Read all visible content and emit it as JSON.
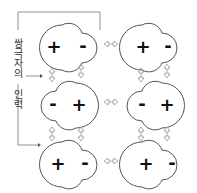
{
  "diagram": {
    "label": "쌍극자의 인력",
    "colors": {
      "outline": "#555555",
      "arrow": "#999999",
      "sign": "#111111"
    },
    "molecules": [
      {
        "row": 0,
        "col": 0,
        "left": "+",
        "right": "-"
      },
      {
        "row": 0,
        "col": 1,
        "left": "+",
        "right": "-"
      },
      {
        "row": 1,
        "col": 0,
        "left": "-",
        "right": "+"
      },
      {
        "row": 1,
        "col": 1,
        "left": "-",
        "right": "+"
      },
      {
        "row": 2,
        "col": 0,
        "left": "+",
        "right": "-"
      },
      {
        "row": 2,
        "col": 1,
        "left": "+",
        "right": "-"
      }
    ]
  }
}
